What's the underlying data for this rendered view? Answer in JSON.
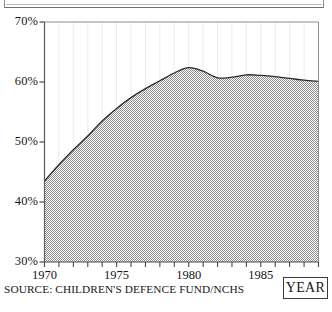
{
  "figure": {
    "source_note": "SOURCE: CHILDREN'S DEFENCE FUND/NCHS",
    "year_box_label": "YEAR"
  },
  "chart_data": {
    "type": "area",
    "title": "",
    "subtitle": "",
    "xlabel": "YEAR",
    "ylabel": "",
    "xlim": [
      1970,
      1989
    ],
    "ylim": [
      30,
      70
    ],
    "grid": "vertical-faint",
    "legend": "none",
    "fill_style": "dithered-gray-halftone",
    "fill_color": "#9a9a9a",
    "line_color": "#2b2b2b",
    "axis_color": "#4a4a4a",
    "background_color": "#ffffff",
    "y_ticks": [
      30,
      40,
      50,
      60,
      70
    ],
    "y_tick_labels": [
      "30%",
      "40%",
      "50%",
      "60%",
      "70%"
    ],
    "x_ticks": [
      1970,
      1971,
      1972,
      1973,
      1974,
      1975,
      1976,
      1977,
      1978,
      1979,
      1980,
      1981,
      1982,
      1983,
      1984,
      1985,
      1986,
      1987,
      1988,
      1989
    ],
    "x_tick_labels_major": [
      "1970",
      "1975",
      "1980",
      "1985"
    ],
    "x_major_ticks": [
      1970,
      1975,
      1980,
      1985
    ],
    "x": [
      1970,
      1971,
      1972,
      1973,
      1974,
      1975,
      1976,
      1977,
      1978,
      1979,
      1980,
      1981,
      1982,
      1983,
      1984,
      1985,
      1986,
      1987,
      1988,
      1989
    ],
    "values": [
      43.5,
      46.2,
      48.7,
      51.0,
      53.5,
      55.6,
      57.4,
      58.9,
      60.2,
      61.5,
      62.4,
      61.8,
      60.7,
      60.8,
      61.2,
      61.1,
      60.9,
      60.6,
      60.3,
      60.1
    ],
    "series": [
      {
        "name": "percentage",
        "values": [
          43.5,
          46.2,
          48.7,
          51.0,
          53.5,
          55.6,
          57.4,
          58.9,
          60.2,
          61.5,
          62.4,
          61.8,
          60.7,
          60.8,
          61.2,
          61.1,
          60.9,
          60.6,
          60.3,
          60.1
        ]
      }
    ],
    "annotations": []
  }
}
